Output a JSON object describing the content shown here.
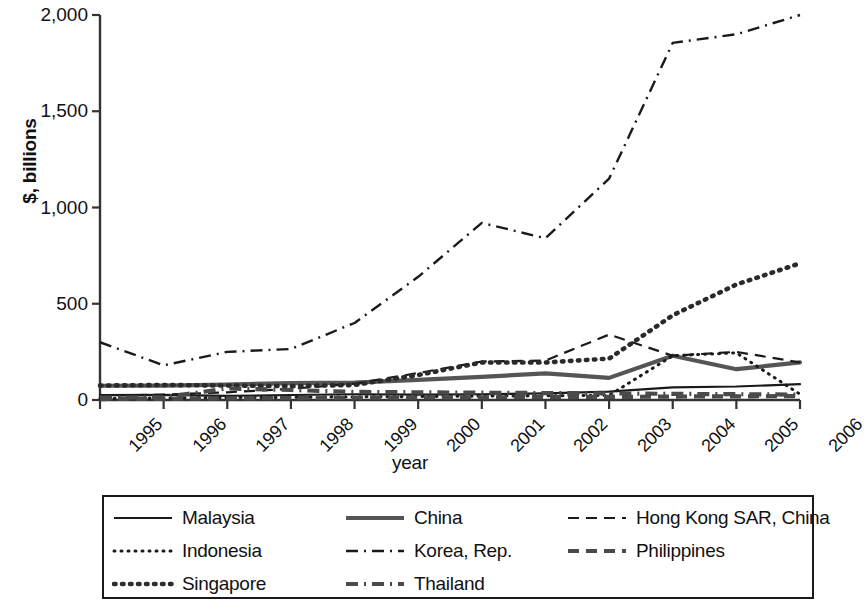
{
  "chart_data": {
    "type": "line",
    "title": "",
    "xlabel": "year",
    "ylabel": "$, billions",
    "x": [
      1995,
      1996,
      1997,
      1998,
      1999,
      2000,
      2001,
      2002,
      2003,
      2004,
      2005,
      2006
    ],
    "categories": [
      "1995",
      "1996",
      "1997",
      "1998",
      "1999",
      "2000",
      "2001",
      "2002",
      "2003",
      "2004",
      "2005",
      "2006"
    ],
    "xlim": [
      1995,
      2006
    ],
    "ylim": [
      0,
      2000
    ],
    "yticks": [
      0,
      500,
      1000,
      1500,
      2000
    ],
    "ytick_labels": [
      "0",
      "500",
      "1,000",
      "1,500",
      "2,000"
    ],
    "grid": false,
    "legend_position": "bottom",
    "legend_columns": 3,
    "series": [
      {
        "name": "Malaysia",
        "style": "solid-thin",
        "color": "#1a1a1a",
        "values": [
          25,
          27,
          21,
          26,
          30,
          28,
          30,
          34,
          44,
          66,
          70,
          82
        ]
      },
      {
        "name": "China",
        "style": "solid-thick",
        "color": "#555555",
        "values": [
          74,
          75,
          80,
          88,
          90,
          105,
          120,
          138,
          115,
          230,
          160,
          195
        ]
      },
      {
        "name": "Hong Kong SAR, China",
        "style": "dashed-thin",
        "color": "#1a1a1a",
        "values": [
          22,
          28,
          40,
          58,
          85,
          140,
          200,
          205,
          340,
          230,
          250,
          195
        ]
      },
      {
        "name": "Indonesia",
        "style": "dotted-fine",
        "color": "#1a1a1a",
        "values": [
          8,
          10,
          12,
          14,
          16,
          18,
          20,
          22,
          24,
          230,
          245,
          30
        ]
      },
      {
        "name": "Korea, Rep.",
        "style": "dashdot-thin",
        "color": "#1a1a1a",
        "values": [
          300,
          180,
          250,
          265,
          400,
          640,
          920,
          840,
          1150,
          1855,
          1900,
          2000
        ]
      },
      {
        "name": "Philippines",
        "style": "dashed-thick",
        "color": "#4a4a4a",
        "values": [
          5,
          6,
          8,
          10,
          12,
          13,
          14,
          15,
          16,
          18,
          19,
          20
        ]
      },
      {
        "name": "Singapore",
        "style": "dotted-bold",
        "color": "#2a2a2a",
        "values": [
          75,
          78,
          75,
          72,
          78,
          130,
          195,
          195,
          215,
          440,
          600,
          710
        ]
      },
      {
        "name": "Thailand",
        "style": "dashdot-thick",
        "color": "#4a4a4a",
        "values": [
          12,
          14,
          60,
          52,
          42,
          40,
          38,
          36,
          34,
          32,
          30,
          28
        ]
      }
    ]
  },
  "legend": {
    "rows": [
      [
        "Malaysia",
        "China",
        "Hong Kong SAR, China"
      ],
      [
        "Indonesia",
        "Korea, Rep.",
        "Philippines"
      ],
      [
        "Singapore",
        "Thailand",
        ""
      ]
    ]
  }
}
